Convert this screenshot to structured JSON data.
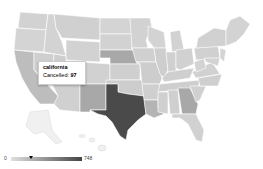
{
  "tooltip": {
    "state": "california",
    "label": "Cancelled:",
    "value": "97"
  },
  "legend": {
    "min": "0",
    "max": "748",
    "marker_value": 97,
    "color_low": "#e0e0e0",
    "color_high": "#444444"
  },
  "map": {
    "region": "United States",
    "metric": "Cancelled",
    "highlighted": [
      {
        "state": "texas",
        "shade": "#4a4a4a"
      },
      {
        "state": "new mexico",
        "shade": "#a8a8a8"
      },
      {
        "state": "nebraska",
        "shade": "#a8a8a8"
      },
      {
        "state": "georgia",
        "shade": "#a8a8a8"
      },
      {
        "state": "louisiana",
        "shade": "#b4b4b4"
      },
      {
        "state": "california",
        "shade": "#bdbdbd"
      }
    ]
  }
}
